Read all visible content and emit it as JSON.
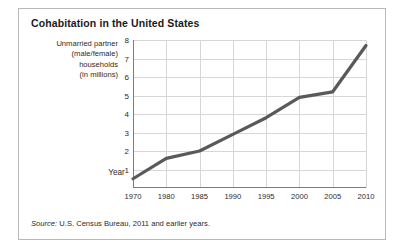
{
  "title": "Cohabitation in the United States",
  "source": {
    "lead": "Source:",
    "text": " U.S. Census Bureau, 2011 and earlier years."
  },
  "ylabel_lines": [
    "Unmarried partner",
    "(male/female)",
    "households",
    "(in millions)"
  ],
  "colors": {
    "line": "#58595b",
    "grid": "#d7d7d7",
    "axis": "#7d7d7d",
    "border": "#b9b9b9",
    "text": "#2b2b2b",
    "title": "#1b1b1b",
    "background": "#ffffff"
  },
  "chart_data": {
    "type": "line",
    "title": "Cohabitation in the United States",
    "xlabel": "Year",
    "ylabel": "Unmarried partner (male/female) households (in millions)",
    "categories": [
      "1970",
      "1980",
      "1985",
      "1990",
      "1995",
      "2000",
      "2005",
      "2010"
    ],
    "values": [
      0.5,
      1.6,
      2.0,
      2.9,
      3.8,
      4.9,
      5.2,
      7.7
    ],
    "yticks": [
      1,
      2,
      3,
      4,
      5,
      6,
      7,
      8
    ],
    "ylim": [
      0,
      8
    ],
    "grid": true,
    "legend": "none",
    "series": [
      {
        "name": "Unmarried partner (male/female) households (in millions)",
        "values": [
          0.5,
          1.6,
          2.0,
          2.9,
          3.8,
          4.9,
          5.2,
          7.7
        ]
      }
    ]
  }
}
